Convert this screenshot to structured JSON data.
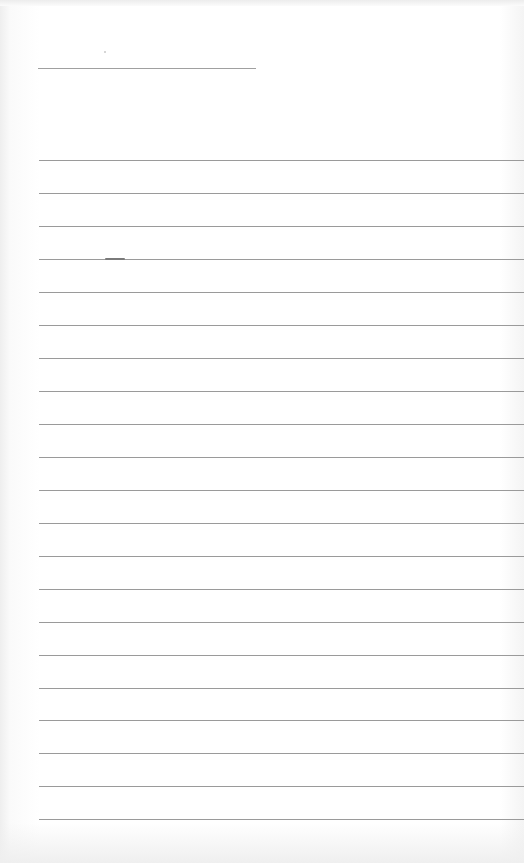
{
  "document": {
    "type": "blank lined form",
    "title_line": {
      "x": 38,
      "y": 68,
      "width": 218
    },
    "ruled_lines": {
      "start_x": 39,
      "end_x": 524,
      "y_positions": [
        160,
        193,
        226,
        259,
        292,
        325,
        358,
        391,
        424,
        457,
        490,
        523,
        556,
        589,
        622,
        655,
        688,
        720,
        753,
        786,
        819
      ],
      "count": 21
    },
    "colors": {
      "paper": "#ffffff",
      "rule": "#9a9a9a"
    }
  }
}
